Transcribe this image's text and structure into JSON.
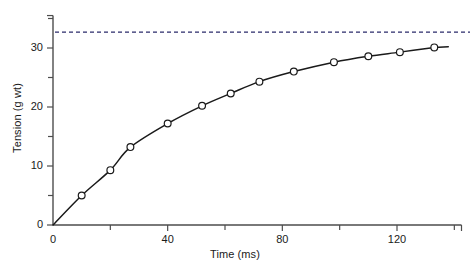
{
  "chart_data": {
    "type": "line",
    "title": "",
    "xlabel": "Time (ms)",
    "ylabel": "Tension (g wt)",
    "xlim": [
      0,
      142.5
    ],
    "ylim": [
      0,
      35.5
    ],
    "grid": false,
    "legend": null,
    "x_major_ticks": [
      0,
      40,
      80,
      120
    ],
    "x_minor_ticks": [
      20,
      60,
      100,
      140
    ],
    "y_major_ticks": [
      0,
      10,
      20,
      30
    ],
    "y_minor_ticks": [
      5,
      15,
      25,
      35
    ],
    "x_tick_labels": [
      "0",
      "40",
      "80",
      "120"
    ],
    "y_tick_labels": [
      "0",
      "10",
      "20",
      "30"
    ],
    "series": [
      {
        "name": "tension",
        "marker": "open-circle",
        "line_color": "#1a1a1a",
        "x": [
          10,
          20,
          27,
          40,
          52,
          62,
          72,
          84,
          98,
          110,
          121,
          133
        ],
        "values": [
          5.0,
          9.3,
          13.2,
          17.2,
          20.2,
          22.3,
          24.3,
          26.0,
          27.6,
          28.6,
          29.3,
          30.1
        ]
      }
    ],
    "annotations": [
      {
        "type": "horizontal-dashed-line",
        "name": "asymptote",
        "y": 32.7,
        "color": "#2b2b6b",
        "label": ""
      }
    ]
  },
  "figure": {
    "background": "#ffffff",
    "axis_color": "#4d4d4d",
    "text_color": "#1a1a1a"
  }
}
